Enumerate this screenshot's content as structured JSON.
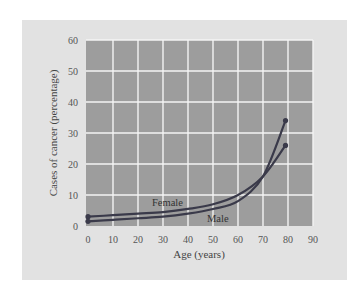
{
  "chart_data": {
    "type": "line",
    "title": "",
    "xlabel": "Age (years)",
    "ylabel": "Cases of cancer (percentage)",
    "xlim": [
      0,
      90
    ],
    "ylim": [
      0,
      60
    ],
    "x_ticks": [
      "0",
      "10",
      "20",
      "30",
      "40",
      "50",
      "60",
      "70",
      "80",
      "90"
    ],
    "y_ticks": [
      "0",
      "10",
      "20",
      "30",
      "40",
      "50",
      "60"
    ],
    "grid": true,
    "legend": "inline labels",
    "series": [
      {
        "name": "Female",
        "x": [
          0,
          10,
          20,
          30,
          40,
          50,
          60,
          70,
          79
        ],
        "values": [
          3,
          3.5,
          4,
          4.5,
          5.5,
          7,
          10,
          16,
          26
        ]
      },
      {
        "name": "Male",
        "x": [
          0,
          10,
          20,
          30,
          40,
          50,
          60,
          70,
          79
        ],
        "values": [
          1.5,
          2,
          2.5,
          3,
          4,
          5.5,
          8,
          16,
          34
        ]
      }
    ]
  },
  "colors": {
    "panel_bg": "#e2e2e2",
    "plot_bg": "#9d9d9d",
    "grid": "#f4f4f4",
    "line": "#3a3a4a"
  }
}
